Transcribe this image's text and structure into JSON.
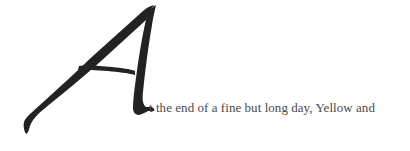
{
  "document": {
    "drop_cap": {
      "letter": "A",
      "color": "#222222"
    },
    "first_line_text": "t the end of a fine but long day, Yellow and"
  }
}
